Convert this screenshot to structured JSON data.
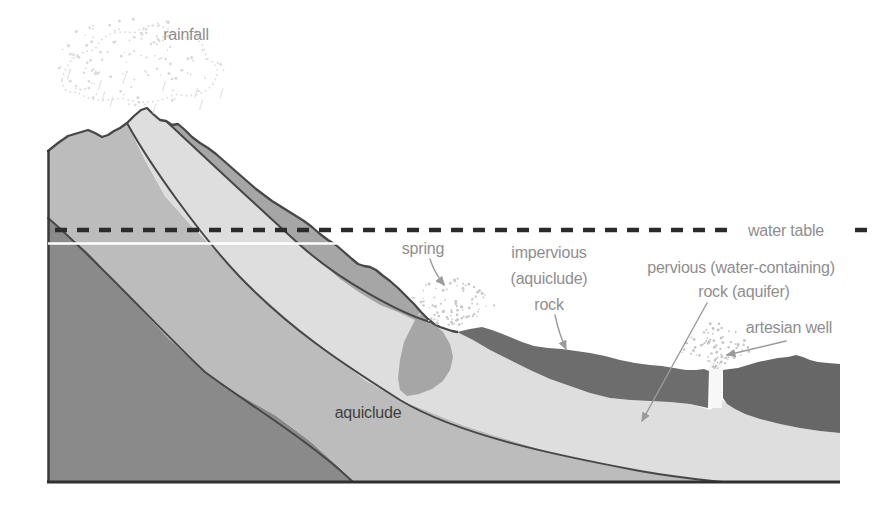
{
  "labels": {
    "rainfall": "rainfall",
    "spring": "spring",
    "impervious_rock_line1": "impervious",
    "impervious_rock_line2": "(aquiclude)",
    "impervious_rock_line3": "rock",
    "pervious_rock_line1": "pervious (water-containing)",
    "pervious_rock_line2": "rock (aquifer)",
    "water_table": "water table",
    "artesian_well": "artesian well",
    "aquiclude": "aquiclude"
  },
  "colors": {
    "background": "#ffffff",
    "slope_surface_layer": "#a6a6a6",
    "aquifer_layer": "#dedede",
    "aquiclude_layer": "#bcbcbc",
    "deep_layer": "#8a8a8a",
    "impervious_layer_left": "#6d6d6d",
    "impervious_layer_right": "#676767",
    "well_shaft": "#f7f7f7",
    "outline": "#474747",
    "water_table_line": "#2b2b2b",
    "label_gray": "#8e8e8e",
    "label_dark": "#3f3f3f"
  }
}
